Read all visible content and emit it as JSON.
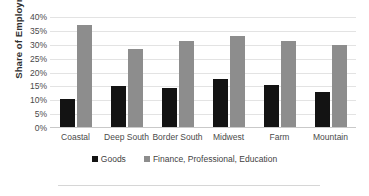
{
  "chart_data": {
    "type": "bar",
    "title": "",
    "xlabel": "",
    "ylabel": "Share of Employment",
    "categories": [
      "Coastal",
      "Deep South",
      "Border South",
      "Midwest",
      "Farm",
      "Mountain"
    ],
    "series": [
      {
        "name": "Goods",
        "color": "#131313",
        "values": [
          10.5,
          15.0,
          14.5,
          17.5,
          15.5,
          13.0
        ]
      },
      {
        "name": "Finance, Professional, Education",
        "color": "#8d8d8d",
        "values": [
          37.0,
          28.5,
          31.5,
          33.0,
          31.5,
          30.0
        ]
      }
    ],
    "ylim": [
      0,
      40
    ],
    "ytick_step": 5,
    "ytick_labels": [
      "40%",
      "35%",
      "30%",
      "25%",
      "20%",
      "15%",
      "10%",
      "5%",
      "0%"
    ],
    "ytick_values": [
      40,
      35,
      30,
      25,
      20,
      15,
      10,
      5,
      0
    ],
    "grid": true,
    "legend_position": "bottom"
  },
  "legend": {
    "entries": [
      {
        "label": "Goods"
      },
      {
        "label": "Finance, Professional, Education"
      }
    ]
  }
}
